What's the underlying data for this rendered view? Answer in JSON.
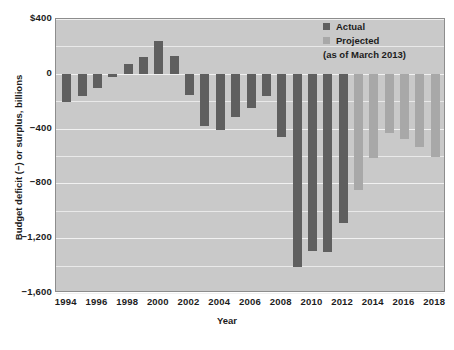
{
  "chart_data": {
    "type": "bar",
    "title": "",
    "xlabel": "Year",
    "ylabel": "Budget deficit (−) or surplus, billions",
    "ylim": [
      -1600,
      400
    ],
    "yticks": [
      400,
      0,
      -400,
      -800,
      -1200,
      -1600
    ],
    "ytick_labels": [
      "$400",
      "0",
      "−400",
      "−800",
      "−1,200",
      "−1,600"
    ],
    "grid": true,
    "grid_orientation": "horizontal",
    "legend_position": "top-right",
    "xlim": [
      1993.3,
      2018.7
    ],
    "xtick_labels": [
      "1994",
      "1996",
      "1998",
      "2000",
      "2002",
      "2004",
      "2006",
      "2008",
      "2010",
      "2012",
      "2014",
      "2016",
      "2018"
    ],
    "xticks": [
      1994,
      1996,
      1998,
      2000,
      2002,
      2004,
      2006,
      2008,
      2010,
      2012,
      2014,
      2016,
      2018
    ],
    "categories": [
      1994,
      1995,
      1996,
      1997,
      1998,
      1999,
      2000,
      2001,
      2002,
      2003,
      2004,
      2005,
      2006,
      2007,
      2008,
      2009,
      2010,
      2011,
      2012,
      2013,
      2014,
      2015,
      2016,
      2017,
      2018
    ],
    "values": [
      -203,
      -164,
      -107,
      -22,
      69,
      126,
      236,
      128,
      -158,
      -378,
      -413,
      -318,
      -248,
      -161,
      -459,
      -1413,
      -1294,
      -1300,
      -1087,
      -845,
      -616,
      -430,
      -476,
      -535,
      -605
    ],
    "series": [
      {
        "name": "Actual",
        "color": "#5f5f5f",
        "points": [
          {
            "year": 1994,
            "value": -203
          },
          {
            "year": 1995,
            "value": -164
          },
          {
            "year": 1996,
            "value": -107
          },
          {
            "year": 1997,
            "value": -22
          },
          {
            "year": 1998,
            "value": 69
          },
          {
            "year": 1999,
            "value": 126
          },
          {
            "year": 2000,
            "value": 236
          },
          {
            "year": 2001,
            "value": 128
          },
          {
            "year": 2002,
            "value": -158
          },
          {
            "year": 2003,
            "value": -378
          },
          {
            "year": 2004,
            "value": -413
          },
          {
            "year": 2005,
            "value": -318
          },
          {
            "year": 2006,
            "value": -248
          },
          {
            "year": 2007,
            "value": -161
          },
          {
            "year": 2008,
            "value": -459
          },
          {
            "year": 2009,
            "value": -1413
          },
          {
            "year": 2010,
            "value": -1294
          },
          {
            "year": 2011,
            "value": -1300
          },
          {
            "year": 2012,
            "value": -1087
          }
        ]
      },
      {
        "name": "Projected",
        "color": "#a8a8a8",
        "points": [
          {
            "year": 2013,
            "value": -845
          },
          {
            "year": 2014,
            "value": -616
          },
          {
            "year": 2015,
            "value": -430
          },
          {
            "year": 2016,
            "value": -476
          },
          {
            "year": 2017,
            "value": -535
          },
          {
            "year": 2018,
            "value": -605
          }
        ]
      }
    ]
  },
  "legend": {
    "actual_label": "Actual",
    "projected_label": "Projected",
    "note": "(as of March 2013)"
  },
  "colors": {
    "actual": "#5f5f5f",
    "projected": "#a8a8a8",
    "plot_background": "#c9c9c9",
    "gridline": "#eeeeee",
    "text": "#1c1c1c"
  }
}
